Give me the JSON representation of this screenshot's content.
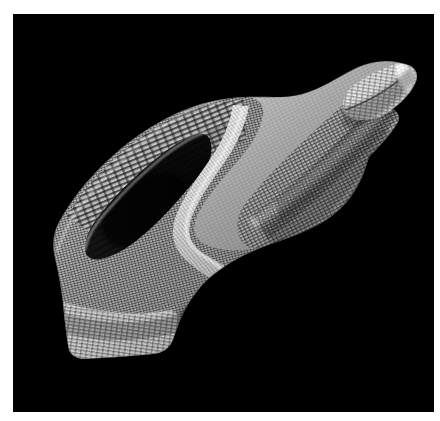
{
  "figure": {
    "domain": "scientific-3d-render",
    "background_color": "#ffffff",
    "canvas_color": "#000000",
    "canvas_rect": {
      "x": 13,
      "y": 14,
      "width": 421,
      "height": 398
    },
    "image_size": {
      "width": 440,
      "height": 421
    },
    "caption": "",
    "title": "",
    "subject_name": "3d-mesh-surface",
    "render_style": "shaded-wireframe-mesh",
    "palette": {
      "background": "#000000",
      "page": "#ffffff",
      "highlight": "#ffffff",
      "surface_light": "#e8e8e8",
      "surface_mid": "#aaaaaa",
      "surface_dark": "#4a4a4a",
      "cavity_shadow": "#121212",
      "mesh_line": "#2b2b2b"
    },
    "lighting": {
      "key_light_direction": "upper-left",
      "ambient": "low",
      "specular_edges": [
        "top-right-fold-rim",
        "central-crease-ridge"
      ]
    },
    "geometry": {
      "orientation": "diagonal, lower-left to upper-right",
      "features": [
        "lower-left cylindrical base cuff with banded mesh",
        "open concave cavity / inner pocket at left-center",
        "central S-shaped crease ridge",
        "broad twisted mid body with fine cross-hatched mesh",
        "upper-right folded rim with bright specular highlight",
        "pointed upper-right tip"
      ],
      "mesh_density": "fine quadrilateral grid, approx 120 x 60 cells"
    },
    "labels": [],
    "annotations": [],
    "axes": null,
    "legend": null,
    "scalebar": null
  }
}
